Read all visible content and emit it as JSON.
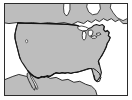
{
  "figure": {
    "kind": "map-thumbnail",
    "width_px": 132,
    "height_px": 100
  },
  "frame": {
    "border_color": "#2b2b2b",
    "border_width_px": 1,
    "inset_left_px": 4,
    "inset_top_px": 3,
    "inner_width_px": 124,
    "inner_height_px": 93,
    "background_color": "#ffffff"
  },
  "page_background_color": "#ffffff",
  "map": {
    "projection_hint": "equirectangular-like continental view",
    "land_fill_color": "#bdbdbd",
    "land_stroke_color": "#1a1a1a",
    "land_stroke_width": 1.1,
    "water_fill_color": "#ffffff",
    "water_stroke_color": "#1a1a1a",
    "border_line_color": "#111111",
    "border_line_width": 1.3,
    "regions": [
      {
        "name": "canada-landmass",
        "label": "Canada",
        "fill": "#bdbdbd",
        "visible": true
      },
      {
        "name": "united-states-landmass",
        "label": "United States",
        "fill": "#bdbdbd",
        "visible": true
      },
      {
        "name": "mexico-landmass",
        "label": "Mexico",
        "fill": "#bdbdbd",
        "visible": true
      }
    ],
    "water_features": [
      {
        "name": "pacific-ocean",
        "label": "Pacific Ocean",
        "fill": "#ffffff"
      },
      {
        "name": "atlantic-ocean",
        "label": "Atlantic Ocean",
        "fill": "#ffffff"
      },
      {
        "name": "gulf-of-mexico",
        "label": "Gulf of Mexico",
        "fill": "#ffffff"
      },
      {
        "name": "great-lakes",
        "label": "Great Lakes",
        "fill": "#ffffff"
      },
      {
        "name": "hudson-bay-inlet",
        "label": "Hudson Bay inlet",
        "fill": "#ffffff"
      },
      {
        "name": "great-salt-lake",
        "label": "Inland lake",
        "fill": "#ffffff"
      }
    ],
    "borders": [
      {
        "name": "us-canada-border",
        "label": "US–Canada border",
        "style": "solid"
      },
      {
        "name": "us-mexico-border",
        "label": "US–Mexico border",
        "style": "solid"
      }
    ],
    "labels": []
  }
}
